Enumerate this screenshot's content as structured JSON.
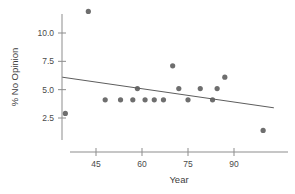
{
  "chart_data": {
    "type": "scatter",
    "title": "",
    "xlabel": "Year",
    "ylabel": "% No Opinion",
    "xlim": [
      32,
      104
    ],
    "ylim": [
      0.6,
      12.6
    ],
    "grid": false,
    "legend": null,
    "x_ticks": [
      45,
      60,
      75,
      90
    ],
    "x_tick_labels": [
      "45",
      "60",
      "75",
      "90"
    ],
    "y_ticks": [
      2.5,
      5.0,
      7.5,
      10.0
    ],
    "y_tick_labels": [
      "2.5",
      "5.0",
      "7.5",
      "10.0"
    ],
    "points": [
      {
        "x": 35.0,
        "y": 2.9
      },
      {
        "x": 42.5,
        "y": 11.9
      },
      {
        "x": 48.0,
        "y": 4.1
      },
      {
        "x": 53.0,
        "y": 4.1
      },
      {
        "x": 57.0,
        "y": 4.1
      },
      {
        "x": 58.5,
        "y": 5.1
      },
      {
        "x": 61.0,
        "y": 4.1
      },
      {
        "x": 64.0,
        "y": 4.1
      },
      {
        "x": 67.0,
        "y": 4.1
      },
      {
        "x": 70.0,
        "y": 7.1
      },
      {
        "x": 72.0,
        "y": 5.1
      },
      {
        "x": 75.0,
        "y": 4.1
      },
      {
        "x": 79.0,
        "y": 5.1
      },
      {
        "x": 83.0,
        "y": 4.1
      },
      {
        "x": 84.5,
        "y": 5.1
      },
      {
        "x": 87.0,
        "y": 6.1
      },
      {
        "x": 99.5,
        "y": 1.4
      }
    ],
    "trend_line": {
      "name": "fitted regression line",
      "x_start": 34.0,
      "y_start": 6.1,
      "x_end": 103.0,
      "y_end": 3.4
    },
    "colors": {
      "point": "#6e6e6e",
      "trend_line": "#5d5d5d",
      "axis": "#8d8d8d",
      "text": "#3d3d3d",
      "background": "#ffffff"
    },
    "point_radius": 2.6
  }
}
